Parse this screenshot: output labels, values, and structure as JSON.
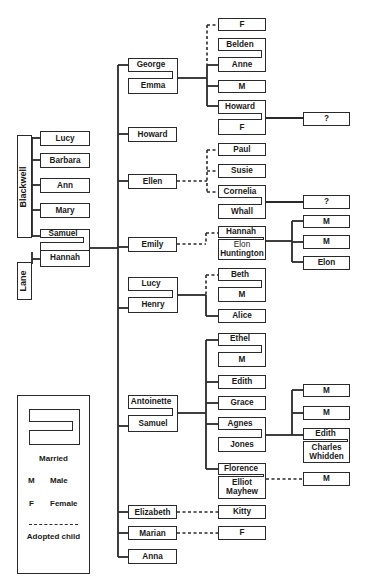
{
  "diagram": {
    "type": "family-tree",
    "surname_labels": {
      "blackwell": "Blackwell",
      "lane": "Lane"
    },
    "blackwell_children": [
      {
        "name": "Lucy"
      },
      {
        "name": "Barbara"
      },
      {
        "name": "Ann"
      },
      {
        "name": "Mary"
      },
      {
        "name": "Samuel",
        "spouse": "Hannah"
      }
    ],
    "generation2": [
      {
        "name": "George",
        "spouse": "Emma"
      },
      {
        "name": "Howard"
      },
      {
        "name": "Ellen"
      },
      {
        "name": "Emily"
      },
      {
        "name": "Lucy",
        "spouse": "Henry"
      },
      {
        "name": "Antoinette",
        "spouse": "Samuel"
      },
      {
        "name": "Elizabeth"
      },
      {
        "name": "Marian"
      },
      {
        "name": "Anna"
      }
    ],
    "george_children": [
      {
        "name": "F",
        "adopted": true
      },
      {
        "name": "Belden",
        "spouse": "Anne"
      },
      {
        "name": "M"
      },
      {
        "name": "Howard",
        "spouse": "F"
      }
    ],
    "howard_child": {
      "name": "?"
    },
    "ellen_children": [
      {
        "name": "Paul",
        "adopted": true
      },
      {
        "name": "Susie",
        "adopted": true
      },
      {
        "name": "Cornelia",
        "spouse": "Whall",
        "adopted": true
      }
    ],
    "cornelia_child": {
      "name": "?"
    },
    "emily_children": [
      {
        "name": "Hannah",
        "spouse_line1": "Elon",
        "spouse_line2": "Huntington",
        "adopted": true
      }
    ],
    "hannah_children": [
      {
        "name": "M"
      },
      {
        "name": "M"
      },
      {
        "name": "Elon"
      }
    ],
    "lucy_children": [
      {
        "name": "Beth",
        "spouse": "M",
        "adopted": true
      },
      {
        "name": "Alice"
      }
    ],
    "antoinette_children": [
      {
        "name": "Ethel",
        "spouse": "M"
      },
      {
        "name": "Edith"
      },
      {
        "name": "Grace"
      },
      {
        "name": "Agnes",
        "spouse": "Jones"
      },
      {
        "name": "Florence",
        "spouse_line1": "Elliot",
        "spouse_line2": "Mayhew"
      }
    ],
    "agnes_children": [
      {
        "name": "M"
      },
      {
        "name": "M"
      },
      {
        "name": "Edith",
        "spouse_line1": "Charles",
        "spouse_line2": "Whidden"
      }
    ],
    "florence_child": {
      "name": "M",
      "adopted": true
    },
    "elizabeth_child": {
      "name": "Kitty",
      "adopted": true
    },
    "marian_child": {
      "name": "F",
      "adopted": true
    }
  },
  "legend": {
    "married_label": "Married",
    "male_key": "M",
    "male_label": "Male",
    "female_key": "F",
    "female_label": "Female",
    "adopted_label": "Adopted child"
  },
  "colors": {
    "line": "#2a2a2a",
    "background": "#ffffff"
  }
}
